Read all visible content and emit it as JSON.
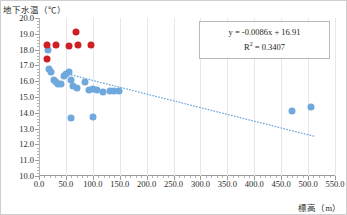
{
  "chart_data": {
    "type": "scatter",
    "title": "",
    "ylabel": "地下水温（℃）",
    "xlabel": "標高（m）",
    "xlim": [
      0,
      550
    ],
    "ylim": [
      10.0,
      20.0
    ],
    "xticks": [
      0.0,
      50.0,
      100.0,
      150.0,
      200.0,
      250.0,
      300.0,
      350.0,
      400.0,
      450.0,
      500.0,
      550.0
    ],
    "xtick_labels": [
      "0.0",
      "50.0",
      "100.0",
      "150.0",
      "200.0",
      "250.0",
      "300.0",
      "350.0",
      "400.0",
      "450.0",
      "500.0",
      "550.0"
    ],
    "yticks": [
      10.0,
      11.0,
      12.0,
      13.0,
      14.0,
      15.0,
      16.0,
      17.0,
      18.0,
      19.0,
      20.0
    ],
    "ytick_labels": [
      "10.0",
      "11.0",
      "12.0",
      "13.0",
      "14.0",
      "15.0",
      "16.0",
      "17.0",
      "18.0",
      "19.0",
      "20.0"
    ],
    "grid": "vertical-major-only",
    "legend": "none",
    "colors": {
      "series_red": "#cd2026",
      "series_blue": "#6fa8dc",
      "trendline": "#6fa8dc",
      "gridline": "#e4e7ee",
      "axis": "#9a9a9a",
      "text": "#2b2b2b"
    },
    "annotations": {
      "equation": "y = -0.0086x + 16.91",
      "r_squared_label": "R",
      "r_squared_exponent": "2",
      "r_squared_value": "= 0.3407",
      "r_squared_full": "R² = 0.3407"
    },
    "trendline_fit": {
      "slope": -0.0086,
      "intercept": 16.91,
      "r_squared": 0.3407,
      "x_start": 55,
      "x_end": 510
    },
    "series": [
      {
        "name": "series_red",
        "color": "#cd2026",
        "points": [
          [
            15,
            18.3
          ],
          [
            15,
            17.4
          ],
          [
            32,
            18.3
          ],
          [
            55,
            18.25
          ],
          [
            68,
            19.1
          ],
          [
            72,
            18.3
          ],
          [
            97,
            18.3
          ]
        ]
      },
      {
        "name": "series_blue",
        "color": "#6fa8dc",
        "points": [
          [
            16,
            17.95
          ],
          [
            18,
            16.75
          ],
          [
            22,
            16.6
          ],
          [
            28,
            16.1
          ],
          [
            32,
            15.95
          ],
          [
            35,
            15.8
          ],
          [
            40,
            15.85
          ],
          [
            46,
            16.35
          ],
          [
            50,
            16.45
          ],
          [
            56,
            16.6
          ],
          [
            60,
            16.05
          ],
          [
            64,
            15.7
          ],
          [
            70,
            15.6
          ],
          [
            86,
            15.95
          ],
          [
            92,
            15.45
          ],
          [
            100,
            15.5
          ],
          [
            108,
            15.45
          ],
          [
            118,
            15.3
          ],
          [
            132,
            15.4
          ],
          [
            140,
            15.35
          ],
          [
            148,
            15.35
          ],
          [
            60,
            13.7
          ],
          [
            100,
            13.75
          ],
          [
            470,
            14.1
          ],
          [
            505,
            14.35
          ]
        ]
      }
    ]
  }
}
